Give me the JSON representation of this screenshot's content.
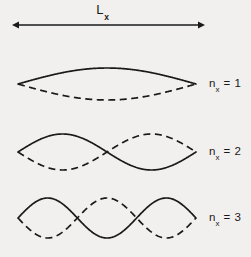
{
  "figure": {
    "background_color": "#f2f0ee",
    "ink_color": "#1a1a1a",
    "length_label": {
      "base": "L",
      "subscript": "x",
      "full": "L_x"
    },
    "modes": [
      {
        "base": "n",
        "subscript": "x",
        "equals": " = ",
        "value": "1"
      },
      {
        "base": "n",
        "subscript": "x",
        "equals": " = ",
        "value": "2"
      },
      {
        "base": "n",
        "subscript": "x",
        "equals": " = ",
        "value": "3"
      }
    ]
  },
  "chart_data": {
    "type": "line",
    "title": "",
    "subtitle": "",
    "xlabel": "L_x",
    "ylabel": "",
    "grid": false,
    "legend_position": "right",
    "axis_arrow": {
      "label": "L_x",
      "x_start": 12,
      "x_end": 205,
      "y": 25,
      "double_headed": true
    },
    "x": [
      0,
      1
    ],
    "xlim": [
      0,
      1
    ],
    "ylim": [
      -1,
      1
    ],
    "annotations": [
      "n_x = 1",
      "n_x = 2",
      "n_x = 3"
    ],
    "series": [
      {
        "name": "n_x = 1 solid",
        "mode_number": 1,
        "style": "solid",
        "panel": 0,
        "amplitude": 1,
        "phase": "positive",
        "formula": "sin(1*pi*x)",
        "center_y": 84,
        "x_start": 18,
        "x_end": 196,
        "pixel_amplitude": 16
      },
      {
        "name": "n_x = 1 dashed",
        "mode_number": 1,
        "style": "dashed",
        "panel": 0,
        "amplitude": -1,
        "phase": "negative",
        "formula": "-sin(1*pi*x)",
        "center_y": 84,
        "x_start": 18,
        "x_end": 196,
        "pixel_amplitude": 16
      },
      {
        "name": "n_x = 2 solid",
        "mode_number": 2,
        "style": "solid",
        "panel": 1,
        "amplitude": 1,
        "phase": "positive",
        "formula": "sin(2*pi*x)",
        "center_y": 152,
        "x_start": 18,
        "x_end": 196,
        "pixel_amplitude": 18
      },
      {
        "name": "n_x = 2 dashed",
        "mode_number": 2,
        "style": "dashed",
        "panel": 1,
        "amplitude": -1,
        "phase": "negative",
        "formula": "-sin(2*pi*x)",
        "center_y": 152,
        "x_start": 18,
        "x_end": 196,
        "pixel_amplitude": 18
      },
      {
        "name": "n_x = 3 solid",
        "mode_number": 3,
        "style": "solid",
        "panel": 2,
        "amplitude": 1,
        "phase": "positive",
        "formula": "sin(3*pi*x)",
        "center_y": 218,
        "x_start": 18,
        "x_end": 196,
        "pixel_amplitude": 20
      },
      {
        "name": "n_x = 3 dashed",
        "mode_number": 3,
        "style": "dashed",
        "panel": 2,
        "amplitude": -1,
        "phase": "negative",
        "formula": "-sin(3*pi*x)",
        "center_y": 218,
        "x_start": 18,
        "x_end": 196,
        "pixel_amplitude": 20
      }
    ]
  }
}
